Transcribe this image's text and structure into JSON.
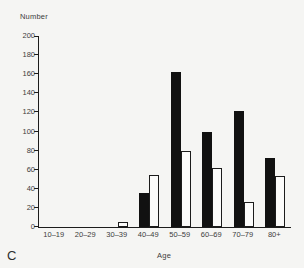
{
  "figure": {
    "panel_label": "C",
    "background": "#f5f5f3",
    "axis_color": "#1c1c1c",
    "text_color": "#3c3c3c"
  },
  "chart_data": {
    "type": "bar",
    "title": "",
    "xlabel": "Age",
    "ylabel": "Number",
    "categories": [
      "10–19",
      "20–29",
      "30–39",
      "40–49",
      "50–59",
      "60–69",
      "70–79",
      "80+"
    ],
    "series": [
      {
        "name": "black",
        "color": "#111111",
        "values": [
          0,
          0,
          0,
          36,
          162,
          100,
          122,
          72
        ]
      },
      {
        "name": "white",
        "color": "#fbfbfa",
        "values": [
          0,
          0,
          5,
          54,
          80,
          62,
          26,
          53
        ]
      }
    ],
    "ylim": [
      0,
      200
    ],
    "yticks": [
      0,
      20,
      40,
      60,
      80,
      100,
      120,
      140,
      160,
      180,
      200
    ],
    "grid": false,
    "legend_position": "none",
    "bar_width_px": 10
  }
}
